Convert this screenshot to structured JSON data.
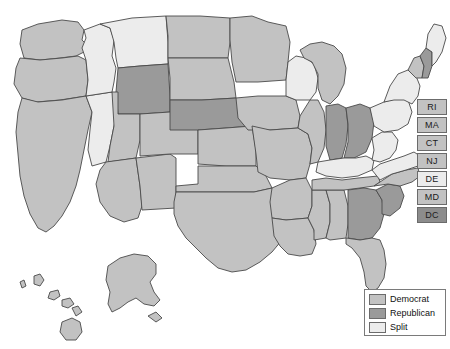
{
  "map": {
    "title": "United States election results map",
    "background_color": "#ffffff",
    "border_color": "#4a4a4a",
    "categories": [
      {
        "key": "dem",
        "label": "Democrat",
        "color": "#c2c2c2"
      },
      {
        "key": "rep",
        "label": "Republican",
        "color": "#9a9a9a"
      },
      {
        "key": "split",
        "label": "Split",
        "color": "#ececec"
      }
    ],
    "states": [
      {
        "code": "WA",
        "name": "Washington",
        "category": "dem"
      },
      {
        "code": "OR",
        "name": "Oregon",
        "category": "dem"
      },
      {
        "code": "CA",
        "name": "California",
        "category": "dem"
      },
      {
        "code": "NV",
        "name": "Nevada",
        "category": "split"
      },
      {
        "code": "ID",
        "name": "Idaho",
        "category": "split"
      },
      {
        "code": "MT",
        "name": "Montana",
        "category": "split"
      },
      {
        "code": "WY",
        "name": "Wyoming",
        "category": "rep"
      },
      {
        "code": "UT",
        "name": "Utah",
        "category": "dem"
      },
      {
        "code": "AZ",
        "name": "Arizona",
        "category": "dem"
      },
      {
        "code": "NM",
        "name": "New Mexico",
        "category": "dem"
      },
      {
        "code": "CO",
        "name": "Colorado",
        "category": "dem"
      },
      {
        "code": "ND",
        "name": "North Dakota",
        "category": "dem"
      },
      {
        "code": "SD",
        "name": "South Dakota",
        "category": "dem"
      },
      {
        "code": "NE",
        "name": "Nebraska",
        "category": "rep"
      },
      {
        "code": "KS",
        "name": "Kansas",
        "category": "dem"
      },
      {
        "code": "OK",
        "name": "Oklahoma",
        "category": "dem"
      },
      {
        "code": "TX",
        "name": "Texas",
        "category": "dem"
      },
      {
        "code": "MN",
        "name": "Minnesota",
        "category": "dem"
      },
      {
        "code": "IA",
        "name": "Iowa",
        "category": "dem"
      },
      {
        "code": "MO",
        "name": "Missouri",
        "category": "dem"
      },
      {
        "code": "AR",
        "name": "Arkansas",
        "category": "dem"
      },
      {
        "code": "LA",
        "name": "Louisiana",
        "category": "dem"
      },
      {
        "code": "WI",
        "name": "Wisconsin",
        "category": "split"
      },
      {
        "code": "IL",
        "name": "Illinois",
        "category": "dem"
      },
      {
        "code": "MS",
        "name": "Mississippi",
        "category": "dem"
      },
      {
        "code": "AL",
        "name": "Alabama",
        "category": "dem"
      },
      {
        "code": "MI",
        "name": "Michigan",
        "category": "dem"
      },
      {
        "code": "IN",
        "name": "Indiana",
        "category": "rep"
      },
      {
        "code": "OH",
        "name": "Ohio",
        "category": "rep"
      },
      {
        "code": "KY",
        "name": "Kentucky",
        "category": "split"
      },
      {
        "code": "TN",
        "name": "Tennessee",
        "category": "dem"
      },
      {
        "code": "GA",
        "name": "Georgia",
        "category": "rep"
      },
      {
        "code": "FL",
        "name": "Florida",
        "category": "dem"
      },
      {
        "code": "SC",
        "name": "South Carolina",
        "category": "rep"
      },
      {
        "code": "NC",
        "name": "North Carolina",
        "category": "dem"
      },
      {
        "code": "VA",
        "name": "Virginia",
        "category": "split"
      },
      {
        "code": "WV",
        "name": "West Virginia",
        "category": "split"
      },
      {
        "code": "PA",
        "name": "Pennsylvania",
        "category": "split"
      },
      {
        "code": "NY",
        "name": "New York",
        "category": "split"
      },
      {
        "code": "VT",
        "name": "Vermont",
        "category": "dem"
      },
      {
        "code": "NH",
        "name": "New Hampshire",
        "category": "rep"
      },
      {
        "code": "ME",
        "name": "Maine",
        "category": "split"
      },
      {
        "code": "AK",
        "name": "Alaska",
        "category": "dem"
      },
      {
        "code": "HI",
        "name": "Hawaii",
        "category": "dem"
      }
    ]
  },
  "abbr_boxes": [
    {
      "code": "RI",
      "name": "Rhode Island",
      "category": "dem"
    },
    {
      "code": "MA",
      "name": "Massachusetts",
      "category": "dem"
    },
    {
      "code": "CT",
      "name": "Connecticut",
      "category": "dem"
    },
    {
      "code": "NJ",
      "name": "New Jersey",
      "category": "dem"
    },
    {
      "code": "DE",
      "name": "Delaware",
      "category": "dem"
    },
    {
      "code": "MD",
      "name": "Maryland",
      "category": "dem"
    },
    {
      "code": "DC",
      "name": "District of Columbia",
      "category": "dc"
    }
  ],
  "legend": {
    "items": [
      {
        "label": "Democrat",
        "color": "#c2c2c2"
      },
      {
        "label": "Republican",
        "color": "#9a9a9a"
      },
      {
        "label": "Split",
        "color": "#ececec"
      }
    ]
  }
}
